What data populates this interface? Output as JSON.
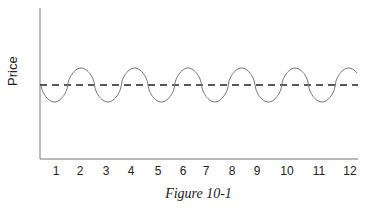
{
  "chart_data": {
    "type": "line",
    "title": "",
    "caption": "Figure 10-1",
    "xlabel": "",
    "ylabel": "Price",
    "categories": [
      "1",
      "2",
      "3",
      "4",
      "5",
      "6",
      "7",
      "8",
      "9",
      "10",
      "11",
      "12"
    ],
    "series": [
      {
        "name": "Price (cyclical wave)",
        "style": "solid",
        "description": "Periodic sine-like oscillation around mean, ~6 cycles across x=1..12, each cycle ~2 units long: trough near odd numbers, peak near even numbers",
        "values_relative": [
          -1,
          1,
          -1,
          1,
          -1,
          1,
          -1,
          1,
          -1,
          1,
          -1,
          1
        ]
      },
      {
        "name": "Mean / trend",
        "style": "dashed",
        "values_relative": [
          0,
          0,
          0,
          0,
          0,
          0,
          0,
          0,
          0,
          0,
          0,
          0
        ]
      }
    ],
    "grid": false,
    "legend": "none",
    "y_ticks": "none"
  }
}
